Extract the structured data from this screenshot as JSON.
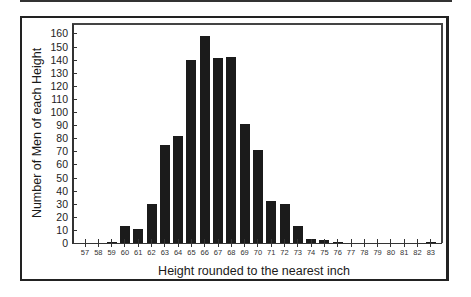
{
  "chart_data": {
    "type": "bar",
    "title": "",
    "xlabel": "Height rounded to the nearest inch",
    "ylabel": "Number of Men of each Height",
    "categories": [
      "57",
      "58",
      "59",
      "60",
      "61",
      "62",
      "63",
      "64",
      "65",
      "66",
      "67",
      "68",
      "69",
      "70",
      "71",
      "72",
      "73",
      "74",
      "75",
      "76",
      "77",
      "78",
      "79",
      "80",
      "81",
      "82",
      "83"
    ],
    "values": [
      0,
      0,
      1,
      13,
      11,
      30,
      75,
      82,
      140,
      158,
      141,
      142,
      91,
      71,
      32,
      30,
      13,
      3,
      2,
      1,
      0,
      0,
      0,
      0,
      0,
      0,
      1
    ],
    "yticks": [
      0,
      10,
      20,
      30,
      40,
      50,
      60,
      70,
      80,
      90,
      100,
      110,
      120,
      130,
      140,
      150,
      160
    ],
    "ylim": [
      0,
      165
    ],
    "grid": false,
    "legend": null,
    "bar_color": "#1b1b1b"
  }
}
